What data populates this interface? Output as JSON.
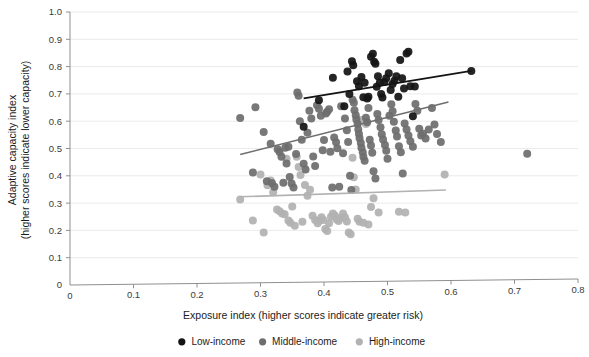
{
  "chart_data": {
    "type": "scatter",
    "title": "",
    "xlabel": "Exposure index (higher scores indicate greater risk)",
    "ylabel_line1": "Adaptive capacity index",
    "ylabel_line2": "(higher scores indicate lower capacity)",
    "xlim": [
      0,
      0.8
    ],
    "ylim": [
      0,
      1.0
    ],
    "xticks": [
      "0",
      "0.1",
      "0.2",
      "0.3",
      "0.4",
      "0.5",
      "0.6",
      "0.7",
      "0.8"
    ],
    "xtick_values": [
      0,
      0.1,
      0.2,
      0.3,
      0.4,
      0.5,
      0.6,
      0.7,
      0.8
    ],
    "yticks": [
      "0",
      "0.1",
      "0.2",
      "0.3",
      "0.4",
      "0.5",
      "0.6",
      "0.7",
      "0.8",
      "0.9",
      "1.0"
    ],
    "ytick_values": [
      0,
      0.1,
      0.2,
      0.3,
      0.4,
      0.5,
      0.6,
      0.7,
      0.8,
      0.9,
      1.0
    ],
    "grid": true,
    "grid_axis": "y",
    "legend_position": "bottom",
    "colors": {
      "low_income": "#141414",
      "middle_income": "#6e6e6e",
      "high_income": "#b2b2b2",
      "gridline": "#eceaea",
      "axis": "#8f8f8f",
      "text": "#1c1c1c"
    },
    "series": [
      {
        "name": "Low-income",
        "color": "#141414",
        "marker": "circle",
        "trendline": {
          "x0": 0.368,
          "y0": 0.684,
          "x1": 0.632,
          "y1": 0.784,
          "color": "#141414",
          "width": 1.8
        },
        "points": [
          [
            0.368,
            0.58
          ],
          [
            0.392,
            0.677
          ],
          [
            0.414,
            0.759
          ],
          [
            0.432,
            0.655
          ],
          [
            0.437,
            0.782
          ],
          [
            0.44,
            0.7
          ],
          [
            0.444,
            0.82
          ],
          [
            0.446,
            0.805
          ],
          [
            0.452,
            0.746
          ],
          [
            0.455,
            0.728
          ],
          [
            0.459,
            0.762
          ],
          [
            0.462,
            0.688
          ],
          [
            0.464,
            0.741
          ],
          [
            0.468,
            0.683
          ],
          [
            0.47,
            0.69
          ],
          [
            0.474,
            0.836
          ],
          [
            0.477,
            0.847
          ],
          [
            0.479,
            0.818
          ],
          [
            0.481,
            0.81
          ],
          [
            0.483,
            0.726
          ],
          [
            0.485,
            0.765
          ],
          [
            0.488,
            0.742
          ],
          [
            0.49,
            0.7
          ],
          [
            0.492,
            0.687
          ],
          [
            0.495,
            0.744
          ],
          [
            0.498,
            0.757
          ],
          [
            0.502,
            0.776
          ],
          [
            0.505,
            0.714
          ],
          [
            0.508,
            0.736
          ],
          [
            0.511,
            0.748
          ],
          [
            0.514,
            0.765
          ],
          [
            0.517,
            0.69
          ],
          [
            0.52,
            0.824
          ],
          [
            0.523,
            0.757
          ],
          [
            0.526,
            0.72
          ],
          [
            0.53,
            0.848
          ],
          [
            0.533,
            0.854
          ],
          [
            0.536,
            0.728
          ],
          [
            0.54,
            0.618
          ],
          [
            0.543,
            0.727
          ],
          [
            0.632,
            0.784
          ]
        ]
      },
      {
        "name": "Middle-income",
        "color": "#6e6e6e",
        "marker": "circle",
        "trendline": {
          "x0": 0.268,
          "y0": 0.478,
          "x1": 0.596,
          "y1": 0.67,
          "color": "#6e6e6e",
          "width": 1.6
        },
        "points": [
          [
            0.268,
            0.612
          ],
          [
            0.288,
            0.412
          ],
          [
            0.292,
            0.651
          ],
          [
            0.305,
            0.56
          ],
          [
            0.31,
            0.38
          ],
          [
            0.316,
            0.517
          ],
          [
            0.318,
            0.374
          ],
          [
            0.322,
            0.36
          ],
          [
            0.327,
            0.497
          ],
          [
            0.33,
            0.487
          ],
          [
            0.333,
            0.47
          ],
          [
            0.336,
            0.375
          ],
          [
            0.339,
            0.503
          ],
          [
            0.341,
            0.445
          ],
          [
            0.344,
            0.506
          ],
          [
            0.346,
            0.396
          ],
          [
            0.349,
            0.372
          ],
          [
            0.352,
            0.357
          ],
          [
            0.356,
            0.48
          ],
          [
            0.358,
            0.705
          ],
          [
            0.36,
            0.693
          ],
          [
            0.362,
            0.6
          ],
          [
            0.365,
            0.532
          ],
          [
            0.368,
            0.444
          ],
          [
            0.371,
            0.423
          ],
          [
            0.374,
            0.558
          ],
          [
            0.377,
            0.638
          ],
          [
            0.38,
            0.61
          ],
          [
            0.383,
            0.471
          ],
          [
            0.386,
            0.436
          ],
          [
            0.389,
            0.658
          ],
          [
            0.392,
            0.646
          ],
          [
            0.395,
            0.62
          ],
          [
            0.398,
            0.494
          ],
          [
            0.4,
            0.531
          ],
          [
            0.403,
            0.628
          ],
          [
            0.405,
            0.635
          ],
          [
            0.408,
            0.644
          ],
          [
            0.41,
            0.488
          ],
          [
            0.413,
            0.357
          ],
          [
            0.416,
            0.54
          ],
          [
            0.419,
            0.523
          ],
          [
            0.421,
            0.501
          ],
          [
            0.424,
            0.36
          ],
          [
            0.427,
            0.655
          ],
          [
            0.43,
            0.483
          ],
          [
            0.433,
            0.61
          ],
          [
            0.436,
            0.567
          ],
          [
            0.438,
            0.524
          ],
          [
            0.441,
            0.4
          ],
          [
            0.443,
            0.348
          ],
          [
            0.445,
            0.679
          ],
          [
            0.447,
            0.668
          ],
          [
            0.448,
            0.64
          ],
          [
            0.45,
            0.622
          ],
          [
            0.451,
            0.606
          ],
          [
            0.453,
            0.59
          ],
          [
            0.454,
            0.57
          ],
          [
            0.455,
            0.553
          ],
          [
            0.456,
            0.538
          ],
          [
            0.458,
            0.52
          ],
          [
            0.459,
            0.503
          ],
          [
            0.461,
            0.486
          ],
          [
            0.462,
            0.47
          ],
          [
            0.464,
            0.455
          ],
          [
            0.466,
            0.613
          ],
          [
            0.468,
            0.596
          ],
          [
            0.47,
            0.648
          ],
          [
            0.472,
            0.532
          ],
          [
            0.474,
            0.511
          ],
          [
            0.476,
            0.484
          ],
          [
            0.478,
            0.417
          ],
          [
            0.481,
            0.39
          ],
          [
            0.484,
            0.626
          ],
          [
            0.486,
            0.604
          ],
          [
            0.489,
            0.578
          ],
          [
            0.491,
            0.552
          ],
          [
            0.493,
            0.533
          ],
          [
            0.496,
            0.513
          ],
          [
            0.498,
            0.492
          ],
          [
            0.5,
            0.462
          ],
          [
            0.503,
            0.62
          ],
          [
            0.506,
            0.662
          ],
          [
            0.508,
            0.636
          ],
          [
            0.51,
            0.598
          ],
          [
            0.513,
            0.566
          ],
          [
            0.515,
            0.544
          ],
          [
            0.518,
            0.508
          ],
          [
            0.521,
            0.486
          ],
          [
            0.524,
            0.408
          ],
          [
            0.527,
            0.592
          ],
          [
            0.53,
            0.57
          ],
          [
            0.533,
            0.548
          ],
          [
            0.536,
            0.527
          ],
          [
            0.54,
            0.506
          ],
          [
            0.544,
            0.663
          ],
          [
            0.547,
            0.638
          ],
          [
            0.55,
            0.572
          ],
          [
            0.553,
            0.548
          ],
          [
            0.556,
            0.554
          ],
          [
            0.56,
            0.537
          ],
          [
            0.565,
            0.57
          ],
          [
            0.57,
            0.648
          ],
          [
            0.574,
            0.588
          ],
          [
            0.578,
            0.553
          ],
          [
            0.584,
            0.524
          ],
          [
            0.72,
            0.481
          ]
        ]
      },
      {
        "name": "High-income",
        "color": "#b2b2b2",
        "marker": "circle",
        "trendline": {
          "x0": 0.268,
          "y0": 0.323,
          "x1": 0.592,
          "y1": 0.348,
          "color": "#b2b2b2",
          "width": 1.6
        },
        "points": [
          [
            0.268,
            0.313
          ],
          [
            0.288,
            0.236
          ],
          [
            0.3,
            0.405
          ],
          [
            0.305,
            0.192
          ],
          [
            0.311,
            0.365
          ],
          [
            0.316,
            0.383
          ],
          [
            0.32,
            0.34
          ],
          [
            0.326,
            0.277
          ],
          [
            0.33,
            0.27
          ],
          [
            0.334,
            0.262
          ],
          [
            0.338,
            0.259
          ],
          [
            0.341,
            0.462
          ],
          [
            0.344,
            0.236
          ],
          [
            0.347,
            0.228
          ],
          [
            0.35,
            0.288
          ],
          [
            0.354,
            0.217
          ],
          [
            0.357,
            0.47
          ],
          [
            0.36,
            0.432
          ],
          [
            0.363,
            0.403
          ],
          [
            0.366,
            0.232
          ],
          [
            0.37,
            0.366
          ],
          [
            0.374,
            0.327
          ],
          [
            0.378,
            0.349
          ],
          [
            0.382,
            0.254
          ],
          [
            0.386,
            0.238
          ],
          [
            0.39,
            0.226
          ],
          [
            0.393,
            0.236
          ],
          [
            0.396,
            0.248
          ],
          [
            0.399,
            0.238
          ],
          [
            0.402,
            0.205
          ],
          [
            0.405,
            0.198
          ],
          [
            0.408,
            0.226
          ],
          [
            0.411,
            0.25
          ],
          [
            0.414,
            0.262
          ],
          [
            0.417,
            0.255
          ],
          [
            0.42,
            0.24
          ],
          [
            0.423,
            0.234
          ],
          [
            0.426,
            0.245
          ],
          [
            0.43,
            0.262
          ],
          [
            0.433,
            0.248
          ],
          [
            0.436,
            0.233
          ],
          [
            0.439,
            0.192
          ],
          [
            0.442,
            0.186
          ],
          [
            0.445,
            0.466
          ],
          [
            0.447,
            0.395
          ],
          [
            0.45,
            0.35
          ],
          [
            0.453,
            0.243
          ],
          [
            0.456,
            0.232
          ],
          [
            0.459,
            0.604
          ],
          [
            0.462,
            0.228
          ],
          [
            0.466,
            0.59
          ],
          [
            0.47,
            0.222
          ],
          [
            0.474,
            0.286
          ],
          [
            0.478,
            0.318
          ],
          [
            0.486,
            0.266
          ],
          [
            0.518,
            0.268
          ],
          [
            0.528,
            0.266
          ],
          [
            0.59,
            0.405
          ]
        ]
      }
    ]
  },
  "legend": {
    "items": [
      {
        "label": "Low-income",
        "color": "#141414"
      },
      {
        "label": "Middle-income",
        "color": "#6e6e6e"
      },
      {
        "label": "High-income",
        "color": "#b2b2b2"
      }
    ]
  }
}
